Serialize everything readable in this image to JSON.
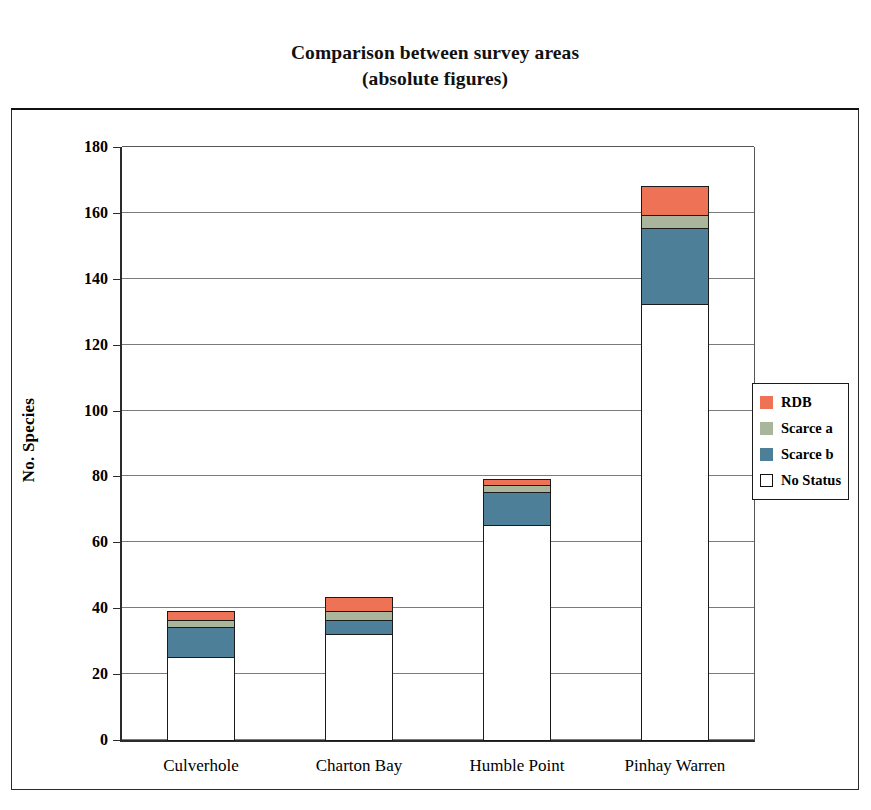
{
  "figure": {
    "title_line1": "Comparison between survey areas",
    "title_line2": "(absolute figures)"
  },
  "chart_data": {
    "type": "bar",
    "stacked": true,
    "title": "Comparison between survey areas (absolute figures)",
    "xlabel": "",
    "ylabel": "No. Species",
    "ylim": [
      0,
      180
    ],
    "ytick_step": 20,
    "yticks": [
      0,
      20,
      40,
      60,
      80,
      100,
      120,
      140,
      160,
      180
    ],
    "ytick_labels": [
      "0",
      "20",
      "40",
      "60",
      "80",
      "100",
      "120",
      "140",
      "160",
      "180"
    ],
    "grid": "horizontal",
    "legend_position": "right-outside",
    "categories": [
      "Culverhole",
      "Charton Bay",
      "Humble Point",
      "Pinhay Warren"
    ],
    "series": [
      {
        "name": "No Status",
        "color": "#ffffff",
        "values": [
          25,
          32,
          65,
          132
        ]
      },
      {
        "name": "Scarce b",
        "color": "#4e7f99",
        "values": [
          9,
          4,
          10,
          23
        ]
      },
      {
        "name": "Scarce a",
        "color": "#aab69c",
        "values": [
          2,
          3,
          2,
          4
        ]
      },
      {
        "name": "RDB",
        "color": "#ee7256",
        "values": [
          3,
          4,
          2,
          9
        ]
      }
    ],
    "totals": [
      39,
      43,
      79,
      168
    ],
    "annotations": []
  },
  "legend": {
    "items": [
      {
        "label": "RDB",
        "color": "#ee7256",
        "style": "filled"
      },
      {
        "label": "Scarce a",
        "color": "#aab69c",
        "style": "filled"
      },
      {
        "label": "Scarce b",
        "color": "#4e7f99",
        "style": "filled"
      },
      {
        "label": "No Status",
        "color": "#ffffff",
        "style": "outlined"
      }
    ]
  },
  "colors": {
    "rdb": "#ee7256",
    "scarce_a": "#aab69c",
    "scarce_b": "#4e7f99",
    "no_status": "#ffffff",
    "axis": "#2b2b2b",
    "grid": "#7b7b7b"
  }
}
